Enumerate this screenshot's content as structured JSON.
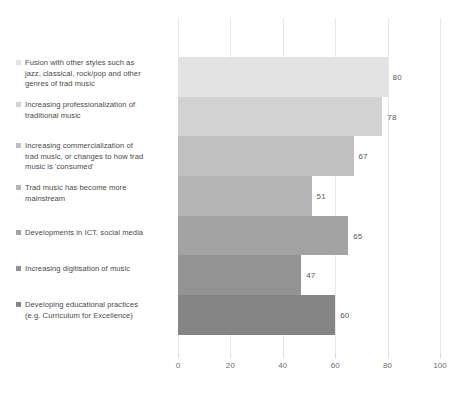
{
  "chart_data": {
    "type": "bar",
    "orientation": "horizontal",
    "title": "",
    "subtitle": "",
    "xlabel": "",
    "ylabel": "",
    "xlim": [
      0,
      100
    ],
    "ylim": null,
    "grid": true,
    "legend_position": "left",
    "xticks": [
      0,
      20,
      40,
      60,
      80,
      100
    ],
    "xtick_labels": [
      "0",
      "20",
      "40",
      "60",
      "80",
      "100"
    ],
    "categories": [
      "Fusion with other styles such as jazz, classical, rock/pop and other genres of trad music",
      "Increasing professionalization of traditional music",
      "Increasing commercialization of trad music, or changes to how trad music is 'consumed'",
      "Trad music has become more mainstream",
      "Developments in ICT, social media",
      "Increasing digitisation of music",
      "Developing educational practices (e.g. Curriculum for Excellence)"
    ],
    "values": [
      80,
      78,
      67,
      51,
      65,
      47,
      60
    ],
    "value_labels": [
      "80",
      "78",
      "67",
      "51",
      "65",
      "47",
      "60"
    ],
    "series": [
      {
        "name": "Responses",
        "values": [
          80,
          78,
          67,
          51,
          65,
          47,
          60
        ]
      }
    ],
    "bar_colors": [
      "#e3e3e3",
      "#d2d2d2",
      "#c0c0c0",
      "#b4b4b4",
      "#a3a3a3",
      "#939393",
      "#858585"
    ]
  },
  "legend": {
    "items": [
      {
        "label": "Fusion with other styles such as\njazz, classical, rock/pop and other\ngenres of trad music",
        "color": "#e3e3e3",
        "top": 58
      },
      {
        "label": "Increasing professionalization of\ntraditional music",
        "color": "#d2d2d2",
        "top": 100
      },
      {
        "label": "Increasing commercialization of\ntrad music, or changes to how trad\nmusic is 'consumed'",
        "color": "#c0c0c0",
        "top": 141
      },
      {
        "label": "Trad music has become more\nmainstream",
        "color": "#b4b4b4",
        "top": 183
      },
      {
        "label": "Developments in ICT, social media",
        "color": "#a3a3a3",
        "top": 228
      },
      {
        "label": "Increasing digitisation of music",
        "color": "#939393",
        "top": 264
      },
      {
        "label": "Developing educational practices\n(e.g. Curriculum for Excellence)",
        "color": "#858585",
        "top": 300
      }
    ]
  },
  "axis": {
    "gridline_color": "#e8e8e8",
    "tick_color": "#d9d9d9",
    "label_color": "#6d6d6d"
  },
  "canvas": {
    "background": "#ffffff",
    "width": 459,
    "height": 402
  }
}
